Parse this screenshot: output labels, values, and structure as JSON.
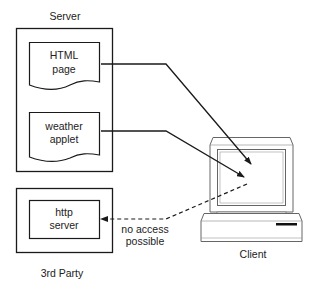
{
  "diagram": {
    "server": {
      "label": "Server",
      "html_page": {
        "line1": "HTML",
        "line2": "page"
      },
      "weather_applet": {
        "line1": "weather",
        "line2": "applet"
      }
    },
    "third_party": {
      "label": "3rd Party",
      "http_server": {
        "line1": "http",
        "line2": "server"
      }
    },
    "client": {
      "label": "Client"
    },
    "connections": {
      "no_access": {
        "line1": "no access",
        "line2": "possible"
      }
    },
    "colors": {
      "stroke": "#1a1a1a",
      "monitor_stroke": "#555555",
      "text": "#222222"
    }
  }
}
